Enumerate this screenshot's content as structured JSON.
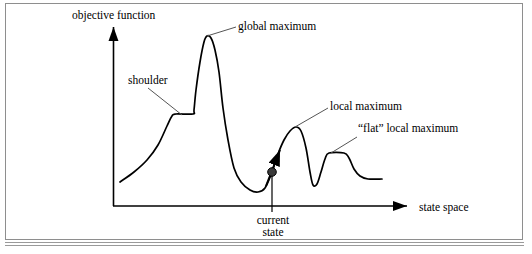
{
  "figure": {
    "type": "state-space-landscape-diagram",
    "axes": {
      "y_label": "objective function",
      "x_label": "state space"
    },
    "annotations": {
      "shoulder": "shoulder",
      "global_maximum": "global maximum",
      "local_maximum": "local maximum",
      "flat_local_maximum": "“flat” local maximum",
      "current_state_line1": "current",
      "current_state_line2": "state"
    },
    "colors": {
      "curve": "#000000",
      "axis": "#000000",
      "leader": "#555555",
      "frame": "#8e8e8e",
      "marker": "#3a3a3a",
      "background": "#ffffff"
    }
  },
  "chart_data": {
    "type": "line",
    "title": "",
    "xlabel": "state space",
    "ylabel": "objective function",
    "grid": false,
    "legend": null,
    "xlim": [
      113,
      413
    ],
    "ylim": [
      206,
      30
    ],
    "axis_origin": [
      113,
      206
    ],
    "y_axis_arrow_tip": [
      113,
      22
    ],
    "x_axis_arrow_tip": [
      413,
      206
    ],
    "series": [
      {
        "name": "objective function landscape",
        "points": [
          [
            120,
            182
          ],
          [
            134,
            172
          ],
          [
            147,
            160
          ],
          [
            158,
            145
          ],
          [
            167,
            126
          ],
          [
            172,
            116
          ],
          [
            176,
            114
          ],
          [
            193,
            114
          ],
          [
            194,
            110
          ],
          [
            196,
            90
          ],
          [
            200,
            62
          ],
          [
            204,
            42
          ],
          [
            207,
            36
          ],
          [
            211,
            38
          ],
          [
            215,
            50
          ],
          [
            219,
            72
          ],
          [
            223,
            108
          ],
          [
            228,
            140
          ],
          [
            234,
            168
          ],
          [
            241,
            182
          ],
          [
            250,
            190
          ],
          [
            258,
            192
          ],
          [
            265,
            188
          ],
          [
            272,
            172
          ],
          [
            278,
            154
          ],
          [
            284,
            140
          ],
          [
            290,
            131
          ],
          [
            296,
            127
          ],
          [
            301,
            131
          ],
          [
            306,
            148
          ],
          [
            310,
            172
          ],
          [
            313,
            185
          ],
          [
            317,
            184
          ],
          [
            321,
            172
          ],
          [
            325,
            159
          ],
          [
            329,
            153
          ],
          [
            344,
            153
          ],
          [
            349,
            158
          ],
          [
            354,
            169
          ],
          [
            360,
            176
          ],
          [
            368,
            179
          ],
          [
            382,
            179
          ]
        ]
      }
    ],
    "features": [
      {
        "name": "shoulder",
        "x_range": [
          172,
          193
        ],
        "y": 114
      },
      {
        "name": "global maximum",
        "x": 207,
        "y": 36
      },
      {
        "name": "current state",
        "x": 272,
        "y": 172
      },
      {
        "name": "local maximum",
        "x": 296,
        "y": 127
      },
      {
        "name": "“flat” local maximum",
        "x_range": [
          329,
          344
        ],
        "y": 153
      }
    ],
    "markers": [
      {
        "name": "current-state-dot",
        "x": 272,
        "y": 172,
        "r": 4.2
      }
    ],
    "arrows": [
      {
        "name": "ascent-direction-arrow",
        "from": [
          268,
          182
        ],
        "to": [
          281,
          147
        ]
      }
    ],
    "leader_lines": [
      {
        "name": "shoulder-leader",
        "from": [
          148,
          88
        ],
        "to": [
          182,
          115
        ]
      },
      {
        "name": "global-maximum-leader",
        "from": [
          236,
          27
        ],
        "to": [
          207,
          36
        ]
      },
      {
        "name": "local-maximum-leader",
        "from": [
          328,
          108
        ],
        "to": [
          295,
          127
        ]
      },
      {
        "name": "flat-local-maximum-leader",
        "from": [
          357,
          137
        ],
        "to": [
          331,
          153
        ]
      }
    ],
    "drop_lines": [
      {
        "name": "current-state-droptline",
        "from": [
          272,
          172
        ],
        "to": [
          272,
          212
        ]
      }
    ]
  }
}
